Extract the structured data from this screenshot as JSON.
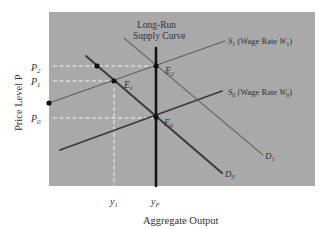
{
  "chart_data": {
    "type": "line",
    "title": "",
    "xlabel": "Aggregate Output",
    "ylabel": "Price Level P",
    "grid": false,
    "background": "#a9a9a9",
    "x_ticks": [
      {
        "label": "y",
        "sub": "1",
        "x": 114
      },
      {
        "label": "y",
        "sub": "F",
        "x": 156
      }
    ],
    "y_ticks": [
      {
        "label": "P",
        "sub": "2",
        "y": 66
      },
      {
        "label": "P",
        "sub": "1",
        "y": 81
      },
      {
        "label": "P",
        "sub": "0",
        "y": 118
      }
    ],
    "series": [
      {
        "name": "Long-Run Supply Curve",
        "label_line1": "Long-Run",
        "label_line2": "Supply Curve",
        "x1": 156,
        "y1": 48,
        "x2": 156,
        "y2": 186,
        "color": "#151515",
        "width": 2.6
      },
      {
        "name": "S1 (Wage Rate W1)",
        "label_main": "S",
        "label_sub": "1",
        "label_rest": " (Wage Rate ",
        "label_w": "W",
        "label_wsub": "1",
        "label_close": ")",
        "x1": 49,
        "y1": 103,
        "x2": 225,
        "y2": 41,
        "color": "#5f5f5f",
        "width": 1.2
      },
      {
        "name": "S0 (Wage Rate W0)",
        "label_main": "S",
        "label_sub": "0",
        "label_rest": " (Wage Rate ",
        "label_w": "W",
        "label_wsub": "0",
        "label_close": ")",
        "x1": 60,
        "y1": 150,
        "x2": 222,
        "y2": 91,
        "color": "#3a3a3a",
        "width": 1.8
      },
      {
        "name": "D0",
        "label_main": "D",
        "label_sub": "0",
        "x1": 86,
        "y1": 56,
        "x2": 222,
        "y2": 173,
        "color": "#3a3a3a",
        "width": 2.0
      },
      {
        "name": "D1",
        "label_main": "D",
        "label_sub": "1",
        "x1": 124,
        "y1": 38,
        "x2": 263,
        "y2": 155,
        "color": "#6a6a6a",
        "width": 1.1
      }
    ],
    "points": [
      {
        "name": "E2",
        "label_main": "E",
        "label_sub": "2",
        "x": 156,
        "y": 66
      },
      {
        "name": "E1",
        "label_main": "E",
        "label_sub": "1",
        "x": 114,
        "y": 81
      },
      {
        "name": "E0",
        "label_main": "E",
        "label_sub": "0",
        "x": 156,
        "y": 117
      },
      {
        "name": "unlabeled-point-on-D0",
        "x": 97,
        "y": 66
      },
      {
        "name": "unlabeled-point-S1-axis",
        "x": 49,
        "y": 103
      }
    ],
    "guides": [
      {
        "from": "P2",
        "x1": 53,
        "y1": 66,
        "x2": 156,
        "y2": 66
      },
      {
        "from": "P1",
        "x1": 53,
        "y1": 81,
        "x2": 114,
        "y2": 81
      },
      {
        "from": "P0",
        "x1": 53,
        "y1": 118,
        "x2": 156,
        "y2": 118
      },
      {
        "from": "y1",
        "x1": 114,
        "y1": 81,
        "x2": 114,
        "y2": 186
      }
    ]
  }
}
